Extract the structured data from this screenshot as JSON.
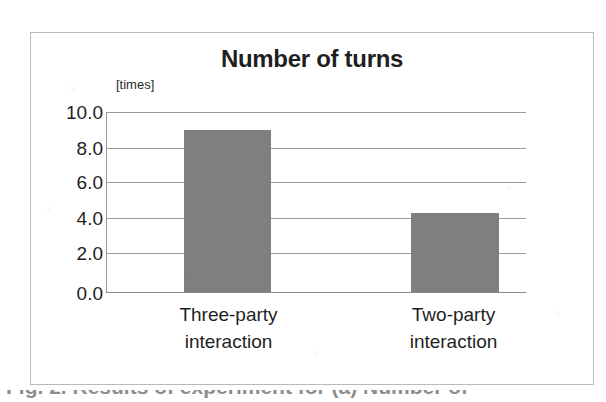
{
  "chart_data": {
    "type": "bar",
    "title": "Number of turns",
    "unit_label": "[times]",
    "categories": [
      "Three-party interaction",
      "Two-party interaction"
    ],
    "category_lines": [
      {
        "line1": "Three-party",
        "line2": "interaction"
      },
      {
        "line1": "Two-party",
        "line2": "interaction"
      }
    ],
    "values": [
      9.0,
      4.4
    ],
    "xlabel": "",
    "ylabel": "[times]",
    "ylim": [
      0.0,
      10.0
    ],
    "ytick_labels": [
      "10.0",
      "8.0",
      "6.0",
      "4.0",
      "2.0",
      "0.0"
    ],
    "ytick_values": [
      10.0,
      8.0,
      6.0,
      4.0,
      2.0,
      0.0
    ],
    "grid": true,
    "legend": false,
    "bar_color": "#7f7f7f",
    "gridline_color": "#9d9d9d",
    "frame_color": "#b9b9b9",
    "text_color": "#1f1f1f"
  },
  "figure": {
    "caption_sliver": "Fig. 2. Results of experiment for (a) Number of"
  }
}
